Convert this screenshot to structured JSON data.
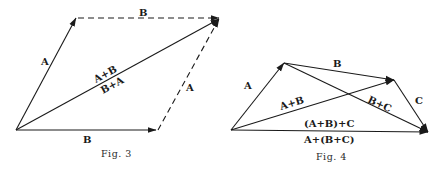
{
  "figures": [
    {
      "id": "fig3",
      "caption": "Fig. 3",
      "description": "Parallelogram law: commutativity of vector addition",
      "points": {
        "origin": [
          16,
          130
        ],
        "a_tip": [
          76,
          18
        ],
        "b_tip": [
          156,
          130
        ],
        "sum_tip": [
          219,
          18
        ]
      },
      "vectors": [
        {
          "name": "A",
          "from": "origin",
          "to": "a_tip",
          "style": "solid"
        },
        {
          "name": "B",
          "from": "origin",
          "to": "b_tip",
          "style": "solid"
        },
        {
          "name": "B",
          "from": "a_tip",
          "to": "sum_tip",
          "style": "dashed"
        },
        {
          "name": "A",
          "from": "b_tip",
          "to": "sum_tip",
          "style": "dashed"
        },
        {
          "name": "A+B",
          "from": "origin",
          "to": "sum_tip",
          "style": "solid"
        }
      ],
      "labels": {
        "a_left": "A",
        "b_top": "B",
        "sum_upper": "A+B",
        "sum_lower": "B+A",
        "a_right": "A",
        "b_bottom": "B"
      }
    },
    {
      "id": "fig4",
      "caption": "Fig. 4",
      "description": "Associativity of vector addition",
      "points": {
        "origin": [
          231,
          130
        ],
        "a_tip": [
          284,
          63
        ],
        "ab_tip": [
          394,
          80
        ],
        "abc_tip": [
          428,
          132
        ]
      },
      "vectors": [
        {
          "name": "A",
          "from": "origin",
          "to": "a_tip",
          "style": "solid"
        },
        {
          "name": "B",
          "from": "a_tip",
          "to": "ab_tip",
          "style": "solid"
        },
        {
          "name": "C",
          "from": "ab_tip",
          "to": "abc_tip",
          "style": "solid"
        },
        {
          "name": "A+B",
          "from": "origin",
          "to": "ab_tip",
          "style": "solid"
        },
        {
          "name": "B+C",
          "from": "a_tip",
          "to": "abc_tip",
          "style": "solid"
        },
        {
          "name": "(A+B)+C",
          "from": "origin",
          "to": "abc_tip",
          "style": "solid"
        }
      ],
      "labels": {
        "a": "A",
        "b": "B",
        "c": "C",
        "ab": "A+B",
        "bc": "B+C",
        "sum_upper": "(A+B)+C",
        "sum_lower": "A+(B+C)"
      }
    }
  ]
}
